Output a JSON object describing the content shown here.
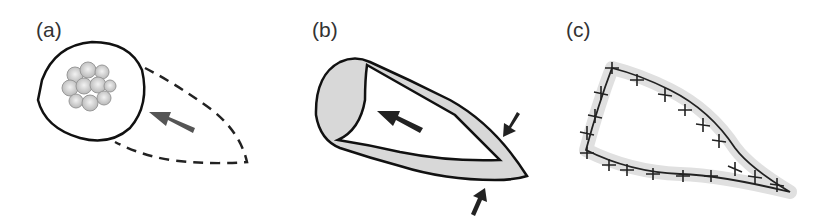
{
  "figure": {
    "panels": [
      {
        "label": "(a)",
        "description": "round lesion with cell cluster; dashed elliptical excision outline with arrow"
      },
      {
        "label": "(b)",
        "description": "excised tissue cone with arrow; compression arrows at tip"
      },
      {
        "label": "(c)",
        "description": "sutured wound closure"
      }
    ],
    "colors": {
      "ink": "#1a1a1a",
      "arrow": "#555555",
      "tissue": "#d9d9d9"
    }
  }
}
